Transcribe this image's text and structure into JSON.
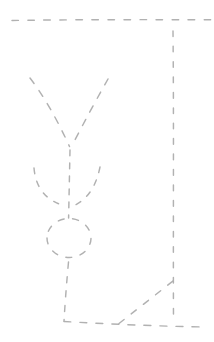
{
  "canvas": {
    "width": 214,
    "height": 342,
    "background_color": "#ffffff"
  },
  "sketch": {
    "stroke_color": "#adadad",
    "stroke_width": 1.45,
    "linecap": "round",
    "strokes": [
      {
        "name": "top-border-dashed-line",
        "path": "M12,20.5 C60,19.6 150,19.5 213,19.8",
        "dash": "6.5 9.5"
      },
      {
        "name": "right-border-dashed-line",
        "path": "M173,31 C173.9,120 173.1,230 173.5,320",
        "dash": "5.6 9.8"
      },
      {
        "name": "bottom-border-dashed-line",
        "path": "M64,321.5 C100,323.5 160,326.5 207,327",
        "dash": "7 9"
      },
      {
        "name": "funnel-left-arm",
        "path": "M30,78 Q50,104 69.5,146.5",
        "dash": "7 8.5"
      },
      {
        "name": "funnel-right-arm",
        "path": "M108,79 Q91,109 71.5,146.5",
        "dash": "7 8.5"
      },
      {
        "name": "arrow-shaft-line",
        "path": "M70,150 L68.6,218",
        "dash": "5.8 7.2"
      },
      {
        "name": "arrowhead-left-barb",
        "path": "M34,168 Q36.5,198 65,206",
        "dash": "5.5 8"
      },
      {
        "name": "arrowhead-right-barb",
        "path": "M100,167 Q94,197 73,206",
        "dash": "5.5 8"
      },
      {
        "name": "node-circle",
        "path": "M47,238 a22,19.5 0 1 0 44,0 a22,19.5 0 1 0 -44,0",
        "dash": "6 8.6"
      },
      {
        "name": "stem-line",
        "path": "M68.5,262 Q65.5,295 64,321",
        "dash": "6 8.4"
      },
      {
        "name": "diagonal-connector-line",
        "path": "M119,323.5 L173,281",
        "dash": "6.5 9"
      }
    ]
  }
}
